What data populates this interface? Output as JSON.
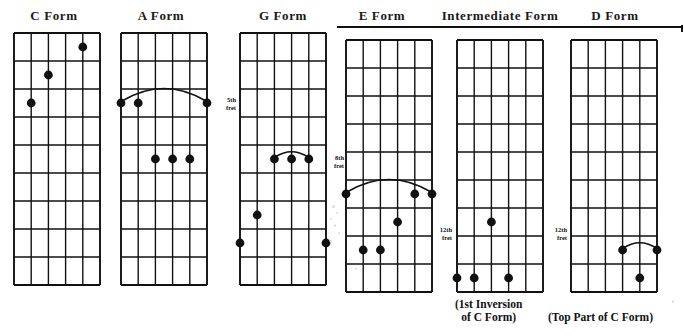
{
  "page": {
    "background_color": "#ffffff",
    "ink_color": "#111111",
    "dot_color": "#111111"
  },
  "title_rule": {
    "present": true,
    "spans_titles": [
      "E Form",
      "Intermediate Form",
      "D Form"
    ]
  },
  "diagrams": [
    {
      "id": "c-form",
      "title": "C Form",
      "title_x": 54,
      "title_y": 8,
      "board": {
        "x": 14,
        "y": 33,
        "width": 86,
        "height": 252,
        "strings": 6,
        "frets": 9
      },
      "fret_label": null,
      "barre": null,
      "dots": [
        {
          "string": 5,
          "fret": 1
        },
        {
          "string": 3,
          "fret": 2
        },
        {
          "string": 2,
          "fret": 3
        }
      ]
    },
    {
      "id": "a-form",
      "title": "A Form",
      "title_x": 161,
      "title_y": 8,
      "board": {
        "x": 121,
        "y": 33,
        "width": 86,
        "height": 252,
        "strings": 6,
        "frets": 9
      },
      "fret_label": null,
      "barre": {
        "fret": 3,
        "from_string": 1,
        "to_string": 6
      },
      "dots": [
        {
          "string": 1,
          "fret": 3
        },
        {
          "string": 2,
          "fret": 3
        },
        {
          "string": 6,
          "fret": 3
        },
        {
          "string": 3,
          "fret": 5
        },
        {
          "string": 4,
          "fret": 5
        },
        {
          "string": 5,
          "fret": 5
        }
      ]
    },
    {
      "id": "g-form",
      "title": "G Form",
      "title_x": 283,
      "title_y": 8,
      "board": {
        "x": 240,
        "y": 33,
        "width": 86,
        "height": 252,
        "strings": 6,
        "frets": 9
      },
      "fret_label": {
        "number": "5th",
        "word": "fret",
        "fret": 5,
        "x": 212,
        "y": 96
      },
      "barre": {
        "fret": 5,
        "from_string": 3,
        "to_string": 5
      },
      "dots": [
        {
          "string": 3,
          "fret": 5
        },
        {
          "string": 4,
          "fret": 5
        },
        {
          "string": 5,
          "fret": 5
        },
        {
          "string": 2,
          "fret": 7
        },
        {
          "string": 1,
          "fret": 8
        },
        {
          "string": 6,
          "fret": 8
        }
      ]
    },
    {
      "id": "e-form",
      "title": "E Form",
      "title_x": 382,
      "title_y": 8,
      "board": {
        "x": 346,
        "y": 40,
        "width": 86,
        "height": 252,
        "strings": 6,
        "frets": 9
      },
      "fret_label": {
        "number": "8th",
        "word": "fret",
        "fret": 6,
        "x": 320,
        "y": 154
      },
      "barre": {
        "fret": 6,
        "from_string": 1,
        "to_string": 6
      },
      "dots": [
        {
          "string": 1,
          "fret": 6
        },
        {
          "string": 5,
          "fret": 6
        },
        {
          "string": 6,
          "fret": 6
        },
        {
          "string": 4,
          "fret": 7
        },
        {
          "string": 2,
          "fret": 8
        },
        {
          "string": 3,
          "fret": 8
        }
      ]
    },
    {
      "id": "intermediate-form",
      "title": "Intermediate Form",
      "title_x": 500,
      "title_y": 8,
      "board": {
        "x": 457,
        "y": 40,
        "width": 86,
        "height": 252,
        "strings": 6,
        "frets": 9
      },
      "fret_label": {
        "number": "12th",
        "word": "fret",
        "fret": 9,
        "x": 428,
        "y": 226
      },
      "barre": null,
      "dots": [
        {
          "string": 3,
          "fret": 7
        },
        {
          "string": 1,
          "fret": 9
        },
        {
          "string": 2,
          "fret": 9
        },
        {
          "string": 4,
          "fret": 9
        },
        {
          "string": 5,
          "fret": 10
        }
      ]
    },
    {
      "id": "d-form",
      "title": "D Form",
      "title_x": 615,
      "title_y": 8,
      "board": {
        "x": 571,
        "y": 40,
        "width": 86,
        "height": 252,
        "strings": 6,
        "frets": 9
      },
      "fret_label": {
        "number": "12th",
        "word": "fret",
        "fret": 8,
        "x": 543,
        "y": 226
      },
      "barre": {
        "fret": 8,
        "from_string": 4,
        "to_string": 6
      },
      "dots": [
        {
          "string": 4,
          "fret": 8
        },
        {
          "string": 6,
          "fret": 8
        },
        {
          "string": 5,
          "fret": 9
        },
        {
          "string": 3,
          "fret": 10
        },
        {
          "string": 2,
          "fret": 11
        }
      ]
    }
  ],
  "captions": [
    {
      "id": "caption-intermediate",
      "lines": [
        "(1st Inversion",
        "of C Form)"
      ],
      "x": 455,
      "y": 298
    },
    {
      "id": "caption-d-form",
      "lines": [
        "(Top Part of C Form)"
      ],
      "x": 548,
      "y": 311
    }
  ]
}
